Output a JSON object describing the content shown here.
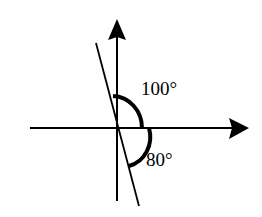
{
  "diagram": {
    "type": "angle-diagram",
    "angles": [
      {
        "label": "100°",
        "value": 100,
        "position": "upper-right, between vertical axis and horizontal axis"
      },
      {
        "label": "80°",
        "value": 80,
        "position": "lower-right, between horizontal axis and slanted line"
      }
    ],
    "colors": {
      "stroke": "#000000",
      "background": "#ffffff"
    }
  },
  "labels": {
    "angle_top": "100°",
    "angle_bottom": "80°"
  }
}
